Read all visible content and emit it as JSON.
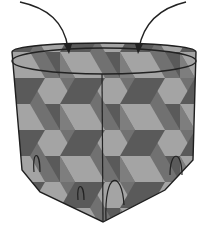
{
  "figure": {
    "colors": {
      "background": "#ffffff",
      "outline": "#222222",
      "light": "#c8c8c8",
      "mid": "#8a8a8a",
      "dark": "#6a6a6a"
    },
    "arrows": [
      {
        "name": "left-arrow",
        "from": [
          20,
          2
        ],
        "to": [
          68,
          52
        ]
      },
      {
        "name": "right-arrow",
        "from": [
          186,
          2
        ],
        "to": [
          138,
          52
        ]
      }
    ]
  }
}
